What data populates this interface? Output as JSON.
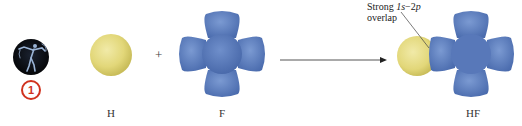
{
  "diagram": {
    "badge": {
      "icon": "golfer-icon",
      "number": "1",
      "color": "#d0321e"
    },
    "reactants": [
      {
        "label": "H",
        "orbital": "1s",
        "shape": "sphere",
        "color": "#e6dc82"
      },
      {
        "label": "F",
        "orbital": "2p",
        "shape": "four-lobed",
        "color": "#5a7fc0"
      }
    ],
    "operator": "+",
    "arrow": "reaction-arrow",
    "product": {
      "label": "HF"
    },
    "annotation": {
      "line1": "Strong 1s−2p",
      "line1_prefix": "Strong ",
      "line1_term1": "1s",
      "line1_sep": "−2",
      "line1_term2": "p",
      "line2": "overlap"
    }
  }
}
